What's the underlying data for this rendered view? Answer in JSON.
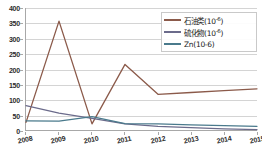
{
  "chart_data": {
    "type": "line",
    "title": "",
    "xlabel": "",
    "ylabel": "",
    "categories": [
      "2008",
      "2009",
      "2010",
      "2011",
      "2012",
      "2013",
      "2014",
      "2015"
    ],
    "ylim": [
      0,
      400
    ],
    "yticks": [
      0,
      50,
      100,
      150,
      200,
      250,
      300,
      350,
      400
    ],
    "grid": true,
    "legend_position": "top-right",
    "series": [
      {
        "name": "石油类(10-6)",
        "color": "#8B5A4A",
        "values": [
          25,
          357,
          20,
          215,
          117,
          123,
          129,
          135
        ]
      },
      {
        "name": "硫化物(10-6)",
        "color": "#6B6B8B",
        "values": [
          80,
          55,
          38,
          20,
          12,
          8,
          4,
          1
        ]
      },
      {
        "name": "Zn(10-6)",
        "color": "#4A7A8C",
        "values": [
          30,
          29,
          44,
          21,
          20,
          17,
          14,
          12
        ]
      }
    ]
  },
  "legend": {
    "items": [
      {
        "label_main": "石油类(10",
        "label_sup": "-6",
        "label_tail": ")",
        "color": "#8B5A4A"
      },
      {
        "label_main": "硫化物(10",
        "label_sup": "-6",
        "label_tail": ")",
        "color": "#6B6B8B"
      },
      {
        "label_main": "Zn(10-6)",
        "label_sup": "",
        "label_tail": "",
        "color": "#4A7A8C"
      }
    ]
  },
  "axis": {
    "y_tick_labels": [
      "400",
      "350",
      "300",
      "250",
      "200",
      "150",
      "100",
      "50",
      "0"
    ],
    "x_tick_labels": [
      "2008",
      "2009",
      "2010",
      "2011",
      "2012",
      "2013",
      "2014",
      "2015"
    ]
  },
  "colors": {
    "gridline": "#d4d4d4",
    "axis": "#a8a8a8",
    "text": "#2b2b2b",
    "background": "#ffffff"
  }
}
